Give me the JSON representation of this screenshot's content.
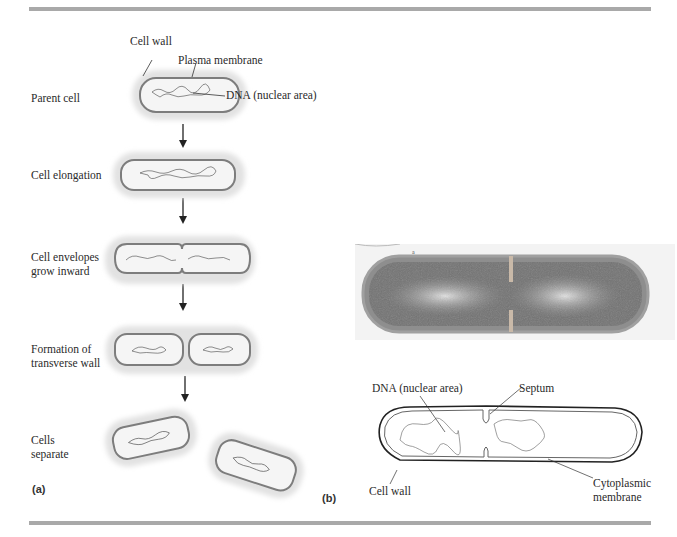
{
  "figure": {
    "panel_a": {
      "label": "(a)",
      "stages": [
        {
          "label": "Parent cell"
        },
        {
          "label": "Cell elongation"
        },
        {
          "label_lines": [
            "Cell envelopes",
            "grow inward"
          ]
        },
        {
          "label_lines": [
            "Formation of",
            "transverse wall"
          ]
        },
        {
          "label_lines": [
            "Cells",
            "separate"
          ]
        }
      ],
      "annotations": {
        "cell_wall": "Cell wall",
        "plasma_membrane": "Plasma membrane",
        "dna": "DNA (nuclear area)"
      }
    },
    "panel_b": {
      "label": "(b)",
      "micrograph_marker": "a",
      "annotations": {
        "dna": "DNA (nuclear area)",
        "septum": "Septum",
        "cell_wall": "Cell wall",
        "cytoplasmic_membrane_lines": [
          "Cytoplasmic",
          "membrane"
        ]
      }
    },
    "colors": {
      "rule": "#a9a9a9",
      "capsule": "#e4e4e4",
      "cytoplasm": "#f4f4f4",
      "membrane": "#7a7a7a",
      "micrograph_dark": "#6e6e6e",
      "micrograph_light": "#d8d8d8"
    }
  }
}
